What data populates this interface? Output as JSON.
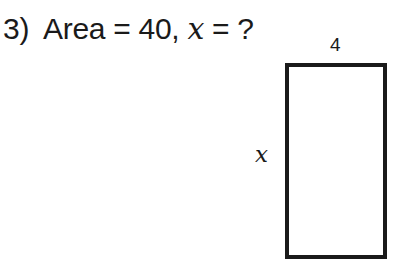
{
  "problem": {
    "number": "3)",
    "prefix": "Area = 40, ",
    "variable": "x",
    "suffix": " = ?"
  },
  "figure": {
    "shape": "rectangle",
    "top_label": "4",
    "side_label": "x",
    "stroke_color": "#1a1a1a"
  }
}
